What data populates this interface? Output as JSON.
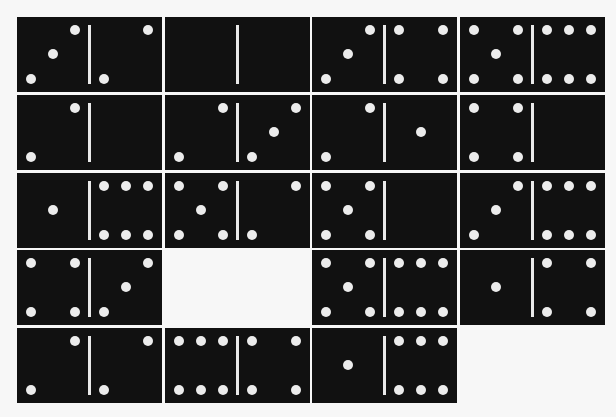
{
  "board": {
    "rows": 5,
    "columns": 4,
    "tiles": [
      {
        "row": 1,
        "col": 1,
        "left": 3,
        "right": 2
      },
      {
        "row": 1,
        "col": 2,
        "left": 0,
        "right": 0
      },
      {
        "row": 1,
        "col": 3,
        "left": 3,
        "right": 4
      },
      {
        "row": 1,
        "col": 4,
        "left": 5,
        "right": 6
      },
      {
        "row": 2,
        "col": 1,
        "left": 2,
        "right": 0
      },
      {
        "row": 2,
        "col": 2,
        "left": 2,
        "right": 3
      },
      {
        "row": 2,
        "col": 3,
        "left": 2,
        "right": 1
      },
      {
        "row": 2,
        "col": 4,
        "left": 4,
        "right": 0
      },
      {
        "row": 3,
        "col": 1,
        "left": 1,
        "right": 6
      },
      {
        "row": 3,
        "col": 2,
        "left": 5,
        "right": 2
      },
      {
        "row": 3,
        "col": 3,
        "left": 5,
        "right": 0
      },
      {
        "row": 3,
        "col": 4,
        "left": 3,
        "right": 6
      },
      {
        "row": 4,
        "col": 1,
        "left": 4,
        "right": 3
      },
      {
        "row": 4,
        "col": 2,
        "empty": true
      },
      {
        "row": 4,
        "col": 3,
        "left": 5,
        "right": 6
      },
      {
        "row": 4,
        "col": 4,
        "left": 1,
        "right": 4
      },
      {
        "row": 5,
        "col": 1,
        "left": 2,
        "right": 2
      },
      {
        "row": 5,
        "col": 2,
        "left": 6,
        "right": 4
      },
      {
        "row": 5,
        "col": 3,
        "left": 1,
        "right": 6
      },
      {
        "row": 5,
        "col": 4,
        "empty": true
      }
    ]
  },
  "colors": {
    "tile": "#111111",
    "pip": "#ececec",
    "divider": "#e9e9e9",
    "background": "#f7f7f7"
  }
}
